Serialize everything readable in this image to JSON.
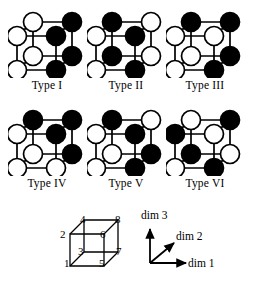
{
  "figure": {
    "colors": {
      "filled": "#000000",
      "empty": "#ffffff",
      "stroke": "#000000",
      "background": "#ffffff"
    },
    "vertex_order": [
      "v1",
      "v2",
      "v3",
      "v4",
      "v5",
      "v6",
      "v7",
      "v8"
    ],
    "vertex_positions": {
      "v1": "front-bottom-left",
      "v2": "front-top-left",
      "v3": "back-bottom-left",
      "v4": "back-top-left",
      "v5": "front-bottom-right",
      "v6": "front-top-right",
      "v7": "back-bottom-right",
      "v8": "back-top-right"
    },
    "cubes": [
      {
        "label": "Type I",
        "name": "type-1",
        "vertices": {
          "v1": "empty",
          "v2": "empty",
          "v3": "empty",
          "v4": "empty",
          "v5": "filled",
          "v6": "filled",
          "v7": "filled",
          "v8": "filled"
        }
      },
      {
        "label": "Type II",
        "name": "type-2",
        "vertices": {
          "v1": "empty",
          "v2": "empty",
          "v3": "filled",
          "v4": "filled",
          "v5": "filled",
          "v6": "filled",
          "v7": "empty",
          "v8": "empty"
        }
      },
      {
        "label": "Type III",
        "name": "type-3",
        "vertices": {
          "v1": "empty",
          "v2": "empty",
          "v3": "empty",
          "v4": "filled",
          "v5": "filled",
          "v6": "empty",
          "v7": "filled",
          "v8": "filled"
        }
      },
      {
        "label": "Type IV",
        "name": "type-4",
        "vertices": {
          "v1": "empty",
          "v2": "empty",
          "v3": "empty",
          "v4": "filled",
          "v5": "empty",
          "v6": "filled",
          "v7": "filled",
          "v8": "filled"
        }
      },
      {
        "label": "Type V",
        "name": "type-5",
        "vertices": {
          "v1": "empty",
          "v2": "empty",
          "v3": "empty",
          "v4": "filled",
          "v5": "filled",
          "v6": "filled",
          "v7": "filled",
          "v8": "empty"
        }
      },
      {
        "label": "Type VI",
        "name": "type-6",
        "vertices": {
          "v1": "empty",
          "v2": "filled",
          "v3": "filled",
          "v4": "empty",
          "v5": "filled",
          "v6": "empty",
          "v7": "empty",
          "v8": "filled"
        }
      }
    ]
  },
  "index_cube": {
    "caption": "vertex numbering",
    "numbers": {
      "n1": "1",
      "n2": "2",
      "n3": "3",
      "n4": "4",
      "n5": "5",
      "n6": "6",
      "n7": "7",
      "n8": "8"
    }
  },
  "axes": {
    "dim1": "dim 1",
    "dim2": "dim 2",
    "dim3": "dim 3"
  }
}
